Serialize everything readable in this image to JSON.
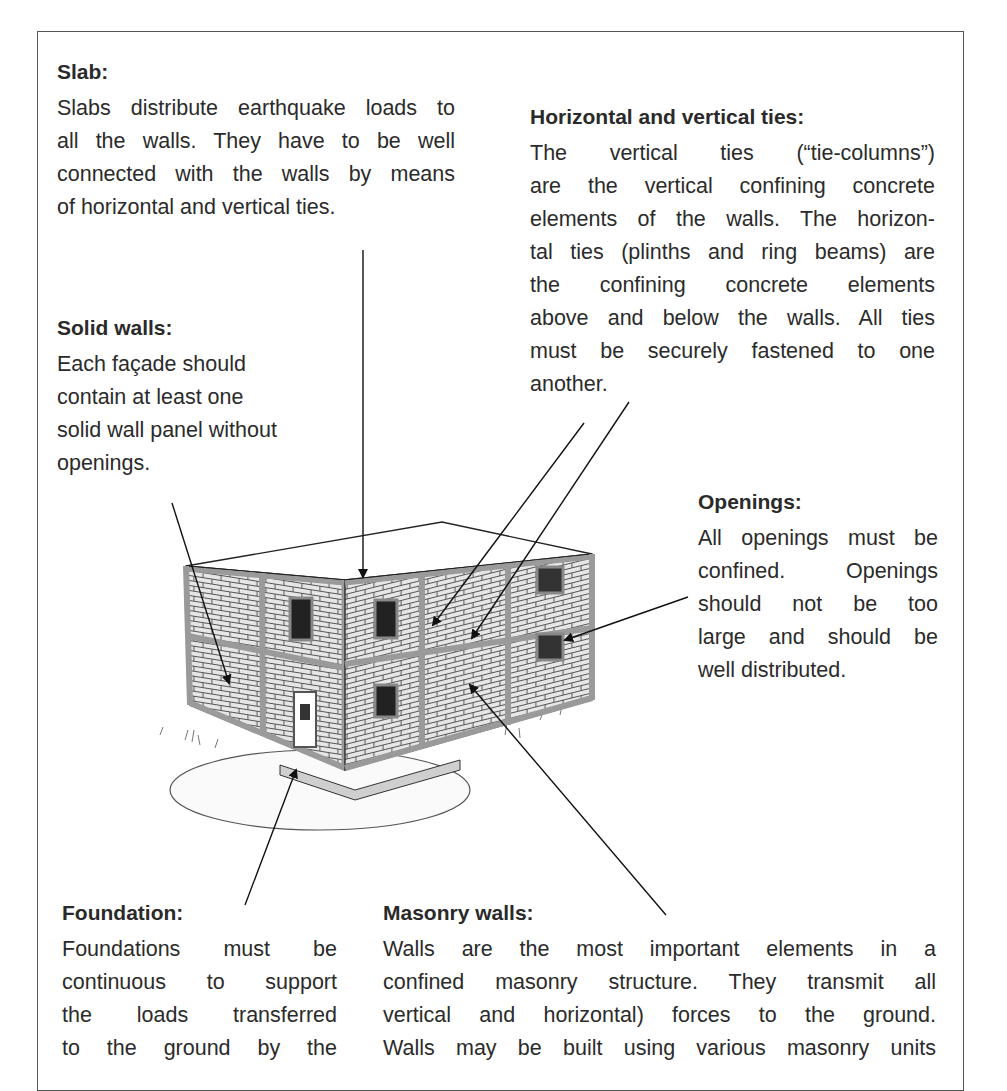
{
  "figure": {
    "border_color": "#555555",
    "text_color": "#2b2b2b"
  },
  "labels": {
    "slab": {
      "heading": "Slab:",
      "lines": [
        "Slabs distribute earthquake loads to",
        "all the walls. They have to be well",
        "connected with the walls by means",
        "of horizontal and vertical ties."
      ]
    },
    "ties": {
      "heading": "Horizontal and vertical ties:",
      "lines": [
        "The vertical ties (“tie-columns”)",
        "are the vertical confining concrete",
        "elements of the walls. The horizon-",
        "tal ties (plinths and ring beams) are",
        "the confining concrete elements",
        "above and below the walls. All ties",
        "must be securely fastened to one",
        "another."
      ]
    },
    "solid_walls": {
      "heading": "Solid walls:",
      "lines": [
        "Each façade should",
        "contain at least one",
        "solid wall panel without",
        "openings."
      ]
    },
    "openings": {
      "heading": "Openings:",
      "lines": [
        "All openings must be",
        "confined. Openings",
        "should not be too",
        "large and should be",
        "well distributed."
      ]
    },
    "foundation": {
      "heading": "Foundation:",
      "lines": [
        "Foundations must be",
        "continuous to support",
        "the loads transferred",
        "to the ground by the"
      ]
    },
    "masonry_walls": {
      "heading": "Masonry walls:",
      "lines": [
        "Walls are the most important elements in a",
        "confined masonry structure. They transmit all",
        "vertical and horizontal) forces to the ground.",
        "Walls may be built using various masonry units"
      ]
    }
  },
  "illustration": {
    "subject": "two-storey confined masonry building sketch",
    "brick_fill": "#d9d9d9",
    "tie_color": "#9a9a9a",
    "line_color": "#222222"
  }
}
